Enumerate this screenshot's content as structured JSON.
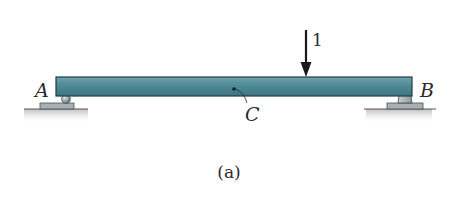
{
  "figure": {
    "caption": "(a)"
  },
  "labels": {
    "support_left": "A",
    "support_right": "B",
    "point": "C",
    "load": "1"
  },
  "supports": {
    "left_type": "roller",
    "right_type": "pin"
  },
  "colors": {
    "beam_fill": "#4f8a96",
    "beam_edge": "#1f3d44",
    "support": "#a9b0b3",
    "ground": "#c8c8c8",
    "arrow": "#1a1a1a"
  }
}
